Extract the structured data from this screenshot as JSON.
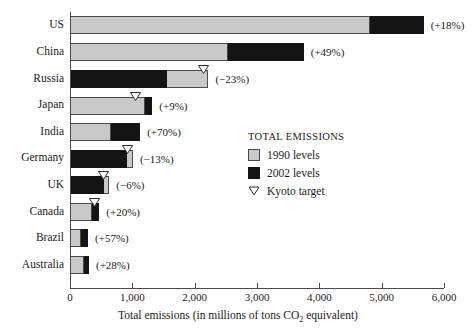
{
  "chart_data": {
    "type": "bar",
    "orientation": "horizontal",
    "stacked": false,
    "title": "",
    "xlabel": "Total emissions (in millions of tons CO2 equivalent)",
    "ylabel": "",
    "xlim": [
      0,
      6000
    ],
    "xticks": [
      0,
      1000,
      2000,
      3000,
      4000,
      5000,
      6000
    ],
    "xticklabels": [
      "0",
      "1,000",
      "2,000",
      "3,000",
      "4,000",
      "5,000",
      "6,000"
    ],
    "grid": false,
    "legend_position": "center-right",
    "categories": [
      "US",
      "China",
      "Russia",
      "Japan",
      "India",
      "Germany",
      "UK",
      "Canada",
      "Brazil",
      "Australia"
    ],
    "series": [
      {
        "name": "1990 levels",
        "color": "#c9c9c9",
        "values": [
          4820,
          2540,
          2220,
          1205,
          660,
          1010,
          630,
          355,
          175,
          225
        ]
      },
      {
        "name": "2002 levels",
        "color": "#141414",
        "values": [
          5675,
          3750,
          1560,
          1320,
          1125,
          915,
          545,
          470,
          290,
          305
        ]
      }
    ],
    "markers": {
      "name": "Kyoto target",
      "values": [
        null,
        null,
        2140,
        1045,
        null,
        920,
        545,
        390,
        null,
        null
      ]
    },
    "annotations": [
      "(+18%)",
      "(+49%)",
      "(−23%)",
      "(+9%)",
      "(+70%)",
      "(−13%)",
      "(−6%)",
      "(+20%)",
      "(+57%)",
      "(+28%)"
    ]
  },
  "legend": {
    "title": "TOTAL EMISSIONS",
    "entries": [
      {
        "label": "1990 levels",
        "swatch": "gray-square-icon"
      },
      {
        "label": "2002 levels",
        "swatch": "black-square-icon"
      },
      {
        "label": "Kyoto target",
        "swatch": "down-triangle-icon"
      }
    ]
  },
  "axis": {
    "x_title_prefix": "Total emissions (in millions of tons CO",
    "x_title_sub": "2",
    "x_title_suffix": " equivalent)"
  }
}
